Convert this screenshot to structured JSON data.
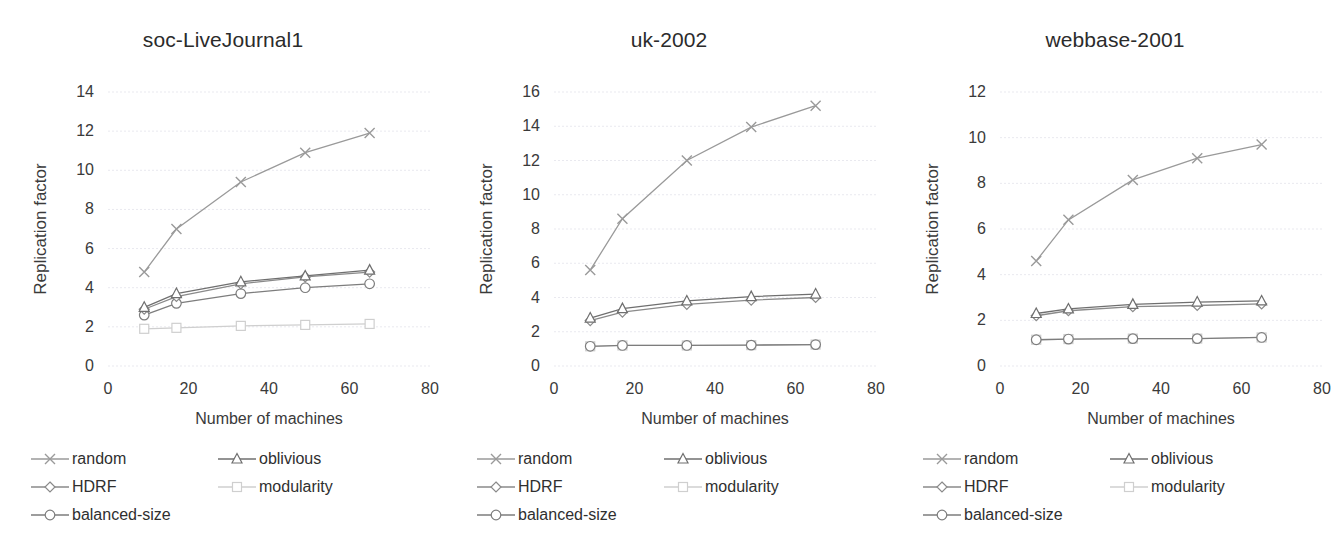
{
  "figure": {
    "panels": [
      "soc-LiveJournal1",
      "uk-2002",
      "webbase-2001"
    ]
  },
  "series_styles": [
    {
      "key": "random",
      "marker": "x",
      "color": "#9a9a9a"
    },
    {
      "key": "oblivious",
      "marker": "triangle",
      "color": "#6f6f6f"
    },
    {
      "key": "HDRF",
      "marker": "diamond",
      "color": "#8a8a8a"
    },
    {
      "key": "modularity",
      "marker": "square",
      "color": "#cfcfcf"
    },
    {
      "key": "balanced-size",
      "marker": "circle",
      "color": "#7d7d7d"
    }
  ],
  "legend": {
    "items": [
      {
        "label": "random",
        "marker": "x"
      },
      {
        "label": "oblivious",
        "marker": "triangle"
      },
      {
        "label": "HDRF",
        "marker": "diamond"
      },
      {
        "label": "modularity",
        "marker": "square"
      },
      {
        "label": "balanced-size",
        "marker": "circle"
      }
    ]
  },
  "chart_data": [
    {
      "type": "line",
      "title": "soc-LiveJournal1",
      "xlabel": "Number of machines",
      "ylabel": "Replication factor",
      "x": [
        9,
        17,
        33,
        49,
        65
      ],
      "xlim": [
        0,
        80
      ],
      "xticks": [
        0,
        20,
        40,
        60,
        80
      ],
      "ylim": [
        0,
        14
      ],
      "yticks": [
        0,
        2,
        4,
        6,
        8,
        10,
        12,
        14
      ],
      "grid": true,
      "legend_position": "bottom",
      "series": [
        {
          "name": "random",
          "values": [
            4.8,
            7.0,
            9.4,
            10.9,
            11.9
          ]
        },
        {
          "name": "oblivious",
          "values": [
            3.0,
            3.7,
            4.3,
            4.6,
            4.9
          ]
        },
        {
          "name": "HDRF",
          "values": [
            2.9,
            3.55,
            4.2,
            4.55,
            4.8
          ]
        },
        {
          "name": "modularity",
          "values": [
            1.9,
            1.95,
            2.05,
            2.1,
            2.15
          ]
        },
        {
          "name": "balanced-size",
          "values": [
            2.6,
            3.2,
            3.7,
            4.0,
            4.2
          ]
        }
      ]
    },
    {
      "type": "line",
      "title": "uk-2002",
      "xlabel": "Number of machines",
      "ylabel": "Replication factor",
      "x": [
        9,
        17,
        33,
        49,
        65
      ],
      "xlim": [
        0,
        80
      ],
      "xticks": [
        0,
        20,
        40,
        60,
        80
      ],
      "ylim": [
        0,
        16
      ],
      "yticks": [
        0,
        2,
        4,
        6,
        8,
        10,
        12,
        14,
        16
      ],
      "grid": true,
      "legend_position": "bottom",
      "series": [
        {
          "name": "random",
          "values": [
            5.6,
            8.6,
            12.0,
            13.95,
            15.2
          ]
        },
        {
          "name": "oblivious",
          "values": [
            2.8,
            3.35,
            3.8,
            4.05,
            4.2
          ]
        },
        {
          "name": "HDRF",
          "values": [
            2.65,
            3.15,
            3.6,
            3.85,
            4.0
          ]
        },
        {
          "name": "modularity",
          "values": [
            1.15,
            1.2,
            1.2,
            1.22,
            1.25
          ]
        },
        {
          "name": "balanced-size",
          "values": [
            1.15,
            1.2,
            1.2,
            1.22,
            1.25
          ]
        }
      ]
    },
    {
      "type": "line",
      "title": "webbase-2001",
      "xlabel": "Number of machines",
      "ylabel": "Replication factor",
      "x": [
        9,
        17,
        33,
        49,
        65
      ],
      "xlim": [
        0,
        80
      ],
      "xticks": [
        0,
        20,
        40,
        60,
        80
      ],
      "ylim": [
        0,
        12
      ],
      "yticks": [
        0,
        2,
        4,
        6,
        8,
        10,
        12
      ],
      "grid": true,
      "legend_position": "bottom",
      "series": [
        {
          "name": "random",
          "values": [
            4.6,
            6.4,
            8.15,
            9.1,
            9.7
          ]
        },
        {
          "name": "oblivious",
          "values": [
            2.3,
            2.5,
            2.7,
            2.8,
            2.85
          ]
        },
        {
          "name": "HDRF",
          "values": [
            2.2,
            2.42,
            2.6,
            2.65,
            2.72
          ]
        },
        {
          "name": "modularity",
          "values": [
            1.15,
            1.18,
            1.2,
            1.2,
            1.25
          ]
        },
        {
          "name": "balanced-size",
          "values": [
            1.15,
            1.18,
            1.2,
            1.2,
            1.25
          ]
        }
      ]
    }
  ]
}
